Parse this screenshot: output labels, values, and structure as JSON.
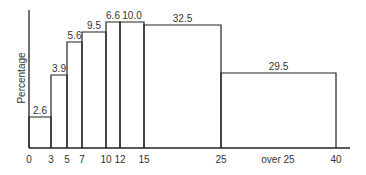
{
  "chart_data": {
    "type": "bar",
    "subtype": "histogram",
    "title": "",
    "xlabel": "",
    "ylabel": "Percentage",
    "x_tick_labels": [
      "0",
      "3",
      "5",
      "7",
      "10",
      "12",
      "15",
      "25",
      "over 25",
      "40"
    ],
    "bins": [
      {
        "from": 0,
        "to": 3,
        "label": "2.6",
        "value": 2.6
      },
      {
        "from": 3,
        "to": 5,
        "label": "3.9",
        "value": 3.9
      },
      {
        "from": 5,
        "to": 7,
        "label": "5.6",
        "value": 5.6
      },
      {
        "from": 7,
        "to": 10,
        "label": "9.5",
        "value": 9.5
      },
      {
        "from": 10,
        "to": 12,
        "label": "6.6",
        "value": 6.6
      },
      {
        "from": 12,
        "to": 15,
        "label": "10.0",
        "value": 10.0
      },
      {
        "from": 15,
        "to": 25,
        "label": "32.5",
        "value": 32.5
      },
      {
        "from": 25,
        "to": 40,
        "label": "29.5",
        "value": 29.5
      }
    ],
    "grid": false,
    "legend": null
  },
  "layout": {
    "axis_x": {
      "x0": 29,
      "x1": 350,
      "y": 148
    },
    "axis_y": {
      "x": 29,
      "y0": 10,
      "y1": 148
    },
    "ticks_px": {
      "0": 29,
      "3": 51,
      "5": 67,
      "7": 82,
      "10": 106,
      "12": 120,
      "15": 144,
      "25": 221,
      "over 25": 278,
      "40": 336
    },
    "bar_tops_px": [
      117,
      75,
      42,
      32,
      22,
      22,
      25,
      73
    ]
  }
}
